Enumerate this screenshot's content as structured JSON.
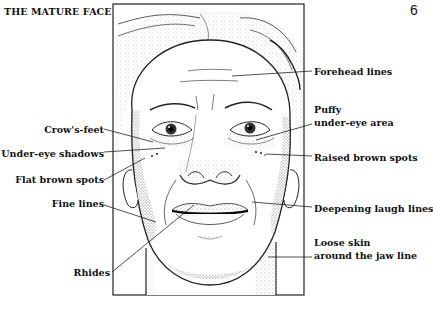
{
  "header": {
    "title": "THE MATURE FACE",
    "page_number": "6"
  },
  "figure": {
    "frame_color": "#222222"
  },
  "labels_left": [
    {
      "text": "Crow's-feet"
    },
    {
      "text": "Under-eye shadows"
    },
    {
      "text": "Flat brown spots"
    },
    {
      "text": "Fine lines"
    },
    {
      "text": "Rhides"
    }
  ],
  "labels_right": [
    {
      "text": "Forehead lines"
    },
    {
      "text_line1": "Puffy",
      "text_line2": "under-eye area"
    },
    {
      "text": "Raised brown spots"
    },
    {
      "text": "Deepening laugh lines"
    },
    {
      "text_line1": "Loose skin",
      "text_line2": "around the jaw line"
    }
  ]
}
